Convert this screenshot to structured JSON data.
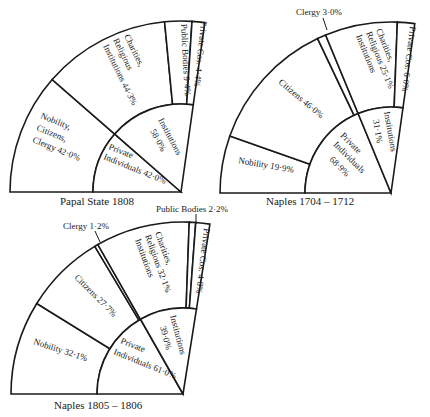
{
  "charts": [
    {
      "title": "Papal State 1808",
      "geometry": {
        "cx": 181,
        "cy": 192,
        "R": 171,
        "r": 88,
        "start": 180,
        "end": 82
      },
      "outer": [
        {
          "label": "Nobility, Citizens, Clergy",
          "value": 42.0,
          "text": "42·0%"
        },
        {
          "label": "Charities, Religious Institutions",
          "value": 44.3,
          "text": "44·3%"
        },
        {
          "label": "Public Bodies",
          "value": 9.4,
          "text": "9·4%"
        },
        {
          "label": "Private Cos.",
          "value": 4.4,
          "text": "4·4%"
        }
      ],
      "inner": [
        {
          "label": "Private Individuals",
          "value": 42.0,
          "text": "42·0%"
        },
        {
          "label": "Institutions",
          "value": 58.0,
          "text": "58·0%"
        }
      ]
    },
    {
      "title": "Naples 1704 – 1712",
      "geometry": {
        "cx": 391,
        "cy": 193,
        "R": 171,
        "r": 86,
        "start": 180,
        "end": 82
      },
      "outer": [
        {
          "label": "Nobility",
          "value": 19.9,
          "text": "19·9%"
        },
        {
          "label": "Citizens",
          "value": 46.0,
          "text": "46·0%"
        },
        {
          "label": "Clergy",
          "value": 3.0,
          "text": "3·0%"
        },
        {
          "label": "Charities, Religious Institutions",
          "value": 25.1,
          "text": "25·1%"
        },
        {
          "label": "Private Cos.",
          "value": 6.0,
          "text": "6·0%"
        }
      ],
      "inner": [
        {
          "label": "Private Individuals",
          "value": 68.9,
          "text": "68·9%"
        },
        {
          "label": "Institutions",
          "value": 31.1,
          "text": "31·1%"
        }
      ]
    },
    {
      "title": "Naples 1805 – 1806",
      "geometry": {
        "cx": 183,
        "cy": 394,
        "R": 172,
        "r": 86,
        "start": 180,
        "end": 81
      },
      "outer": [
        {
          "label": "Nobility",
          "value": 32.1,
          "text": "32·1%"
        },
        {
          "label": "Citizens",
          "value": 27.7,
          "text": "27·7%"
        },
        {
          "label": "Clergy",
          "value": 1.2,
          "text": "1·2%"
        },
        {
          "label": "Charities, Religious Institutions",
          "value": 32.1,
          "text": "32·1%"
        },
        {
          "label": "Public Bodies",
          "value": 2.2,
          "text": "2·2%"
        },
        {
          "label": "Private Cos.",
          "value": 4.8,
          "text": "4·8%"
        }
      ],
      "inner": [
        {
          "label": "Private Individuals",
          "value": 61.0,
          "text": "61·0%"
        },
        {
          "label": "Institutions",
          "value": 39.0,
          "text": "39·0%"
        }
      ]
    }
  ],
  "labels": {
    "c1": {
      "nobility_l1": "Nobility,",
      "nobility_l2": "Citizens,",
      "nobility_l3": "Clergy   42·0%",
      "charities_l1": "Charities,",
      "charities_l2": "Religious",
      "charities_l3": "Institutions  44·3%",
      "public": "Public Bodies 9·4%",
      "privcos": "Private Cos. 4·4%",
      "inst_l1": "Institutions",
      "inst_l2": "58·0%",
      "priv_l1": "Private",
      "priv_l2": "Individuals  42·0%"
    },
    "c2": {
      "clergy": "Clergy 3·0%",
      "charities_l1": "Charities,",
      "charities_l2": "Religious 25·1%",
      "charities_l3": "Institutions",
      "privcos": "Private Cos. 6·0%",
      "citizens": "Citizens 46·0%",
      "nobility": "Nobility 19·9%",
      "inst_l1": "Institutions",
      "inst_l2": "31·1%",
      "priv_l1": "Private",
      "priv_l2": "Individuals",
      "priv_l3": "68·9%"
    },
    "c3": {
      "clergy": "Clergy 1·2%",
      "public": "Public Bodies 2·2%",
      "charities_l1": "Charities,",
      "charities_l2": "Religious 32·1%",
      "charities_l3": "Institutions",
      "privcos": "Private Cos. 4·8%",
      "citizens": "Citizens 27·7%",
      "nobility": "Nobility 32·1%",
      "inst_l1": "Institutions",
      "inst_l2": "39·0%",
      "priv_l1": "Private",
      "priv_l2": "Individuals 61·0%"
    }
  }
}
